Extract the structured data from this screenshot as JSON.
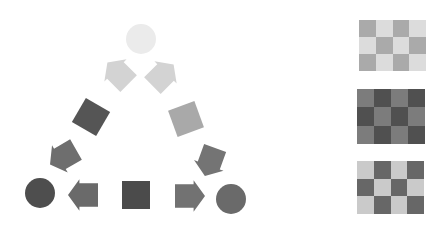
{
  "figure": {
    "background": "#ffffff"
  },
  "triangle": {
    "shapes": [
      {
        "id": "top-circle",
        "type": "circle",
        "cx": 141,
        "cy": 39,
        "r": 15,
        "color": "#ebebeb"
      },
      {
        "id": "arrow-upper-left",
        "type": "arrow",
        "cx": 118,
        "cy": 73,
        "size": 30,
        "rotation": -135,
        "color": "#d3d3d3"
      },
      {
        "id": "arrow-upper-right",
        "type": "arrow",
        "cx": 163,
        "cy": 75,
        "size": 30,
        "rotation": -45,
        "color": "#d3d3d3"
      },
      {
        "id": "square-mid-left",
        "type": "square",
        "cx": 91,
        "cy": 117,
        "size": 28,
        "rotation": 30,
        "color": "#555555"
      },
      {
        "id": "square-mid-right",
        "type": "square",
        "cx": 186,
        "cy": 119,
        "size": 28,
        "rotation": -20,
        "color": "#a9a9a9"
      },
      {
        "id": "arrow-lower-left",
        "type": "arrow",
        "cx": 63,
        "cy": 157,
        "size": 30,
        "rotation": 150,
        "color": "#6e6e6e"
      },
      {
        "id": "arrow-lower-right",
        "type": "arrow",
        "cx": 210,
        "cy": 162,
        "size": 30,
        "rotation": 110,
        "color": "#747474"
      },
      {
        "id": "circle-bottom-left",
        "type": "circle",
        "cx": 40,
        "cy": 193,
        "r": 15,
        "color": "#4e4e4e"
      },
      {
        "id": "arrow-bottom-left",
        "type": "arrow",
        "cx": 83,
        "cy": 195,
        "size": 30,
        "rotation": 180,
        "color": "#6a6a6a"
      },
      {
        "id": "square-bottom",
        "type": "square",
        "cx": 136,
        "cy": 195,
        "size": 28,
        "rotation": 0,
        "color": "#4b4b4b"
      },
      {
        "id": "arrow-bottom-right",
        "type": "arrow",
        "cx": 190,
        "cy": 196,
        "size": 30,
        "rotation": 0,
        "color": "#727272"
      },
      {
        "id": "circle-bottom-right",
        "type": "circle",
        "cx": 231,
        "cy": 199,
        "r": 15,
        "color": "#6a6a6a"
      }
    ]
  },
  "checkerboards": [
    {
      "id": "board-light",
      "x": 359,
      "y": 20,
      "width": 67,
      "height": 51,
      "cols": 4,
      "rows": 3,
      "color_a": "#aaaaaa",
      "color_b": "#dcdcdc"
    },
    {
      "id": "board-dark",
      "x": 357,
      "y": 89,
      "width": 68,
      "height": 55,
      "cols": 4,
      "rows": 3,
      "color_a": "#7c7c7c",
      "color_b": "#505050"
    },
    {
      "id": "board-mixed",
      "x": 357,
      "y": 161,
      "width": 67,
      "height": 53,
      "cols": 4,
      "rows": 3,
      "color_a": "#cacaca",
      "color_b": "#676767"
    }
  ]
}
